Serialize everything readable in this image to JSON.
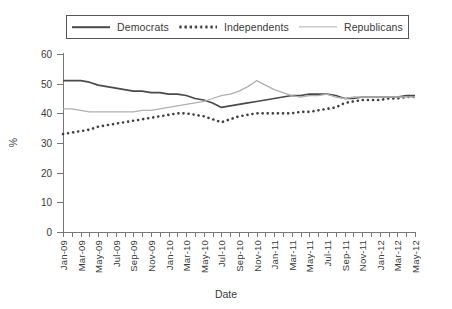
{
  "legend": {
    "position": "top",
    "entries": [
      {
        "label": "Democrats",
        "style": "solid-dark",
        "color": "#4a4a4a"
      },
      {
        "label": "Independents",
        "style": "dotted",
        "color": "#3f3f3f"
      },
      {
        "label": "Republicans",
        "style": "solid-light",
        "color": "#b0b0b0"
      }
    ]
  },
  "axes": {
    "ylabel": "%",
    "xlabel": "Date",
    "yticks": [
      0,
      10,
      20,
      30,
      40,
      50,
      60
    ],
    "ylim": [
      0,
      60
    ],
    "xtick_labels": [
      "Jan-09",
      "Mar-09",
      "May-09",
      "Jul-09",
      "Sep-09",
      "Nov-09",
      "Jan-10",
      "Mar-10",
      "May-10",
      "Jul-10",
      "Sep-10",
      "Nov-10",
      "Jan-11",
      "Mar-11",
      "May-11",
      "Jul-11",
      "Sep-11",
      "Nov-11",
      "Jan-12",
      "Mar-12",
      "May-12"
    ]
  },
  "chart_data": {
    "type": "line",
    "title": "",
    "xlabel": "Date",
    "ylabel": "%",
    "ylim": [
      0,
      60
    ],
    "grid": false,
    "legend_position": "top",
    "categories": [
      "Jan-09",
      "Feb-09",
      "Mar-09",
      "Apr-09",
      "May-09",
      "Jun-09",
      "Jul-09",
      "Aug-09",
      "Sep-09",
      "Oct-09",
      "Nov-09",
      "Dec-09",
      "Jan-10",
      "Feb-10",
      "Mar-10",
      "Apr-10",
      "May-10",
      "Jun-10",
      "Jul-10",
      "Aug-10",
      "Sep-10",
      "Oct-10",
      "Nov-10",
      "Dec-10",
      "Jan-11",
      "Feb-11",
      "Mar-11",
      "Apr-11",
      "May-11",
      "Jun-11",
      "Jul-11",
      "Aug-11",
      "Sep-11",
      "Oct-11",
      "Nov-11",
      "Dec-11",
      "Jan-12",
      "Feb-12",
      "Mar-12",
      "Apr-12",
      "May-12"
    ],
    "series": [
      {
        "name": "Democrats",
        "color": "#4a4a4a",
        "style": "solid",
        "values": [
          51,
          51,
          51,
          50.5,
          49.5,
          49,
          48.5,
          48,
          47.5,
          47.5,
          47,
          47,
          46.5,
          46.5,
          46,
          45,
          44.5,
          43.5,
          42,
          42.5,
          43,
          43.5,
          44,
          44.5,
          45,
          45.5,
          46,
          46,
          46.5,
          46.5,
          46.5,
          46,
          45,
          45,
          45.5,
          45.5,
          45.5,
          45.5,
          45.5,
          46,
          46
        ]
      },
      {
        "name": "Independents",
        "color": "#3f3f3f",
        "style": "dotted",
        "values": [
          33,
          33.5,
          34,
          34.5,
          35.5,
          36,
          36.5,
          37,
          37.5,
          38,
          38.5,
          39,
          39.5,
          40,
          40,
          39.5,
          39,
          38,
          37,
          38,
          39,
          39.5,
          40,
          40,
          40,
          40,
          40,
          40.5,
          40.5,
          41,
          41.5,
          42,
          43.5,
          44,
          44.5,
          44.5,
          44.5,
          45,
          45,
          45.5,
          45.5
        ]
      },
      {
        "name": "Republicans",
        "color": "#b0b0b0",
        "style": "solid",
        "values": [
          41.5,
          41.5,
          41,
          40.5,
          40.5,
          40.5,
          40.5,
          40.5,
          40.5,
          41,
          41,
          41.5,
          42,
          42.5,
          43,
          43.5,
          44,
          45,
          46,
          46.5,
          47.5,
          49,
          51,
          49.5,
          48,
          47,
          46,
          45.5,
          46,
          46,
          46.5,
          45.5,
          45,
          45.5,
          45.5,
          45.5,
          45.5,
          45.5,
          45.5,
          45.5,
          45.5
        ]
      }
    ]
  }
}
